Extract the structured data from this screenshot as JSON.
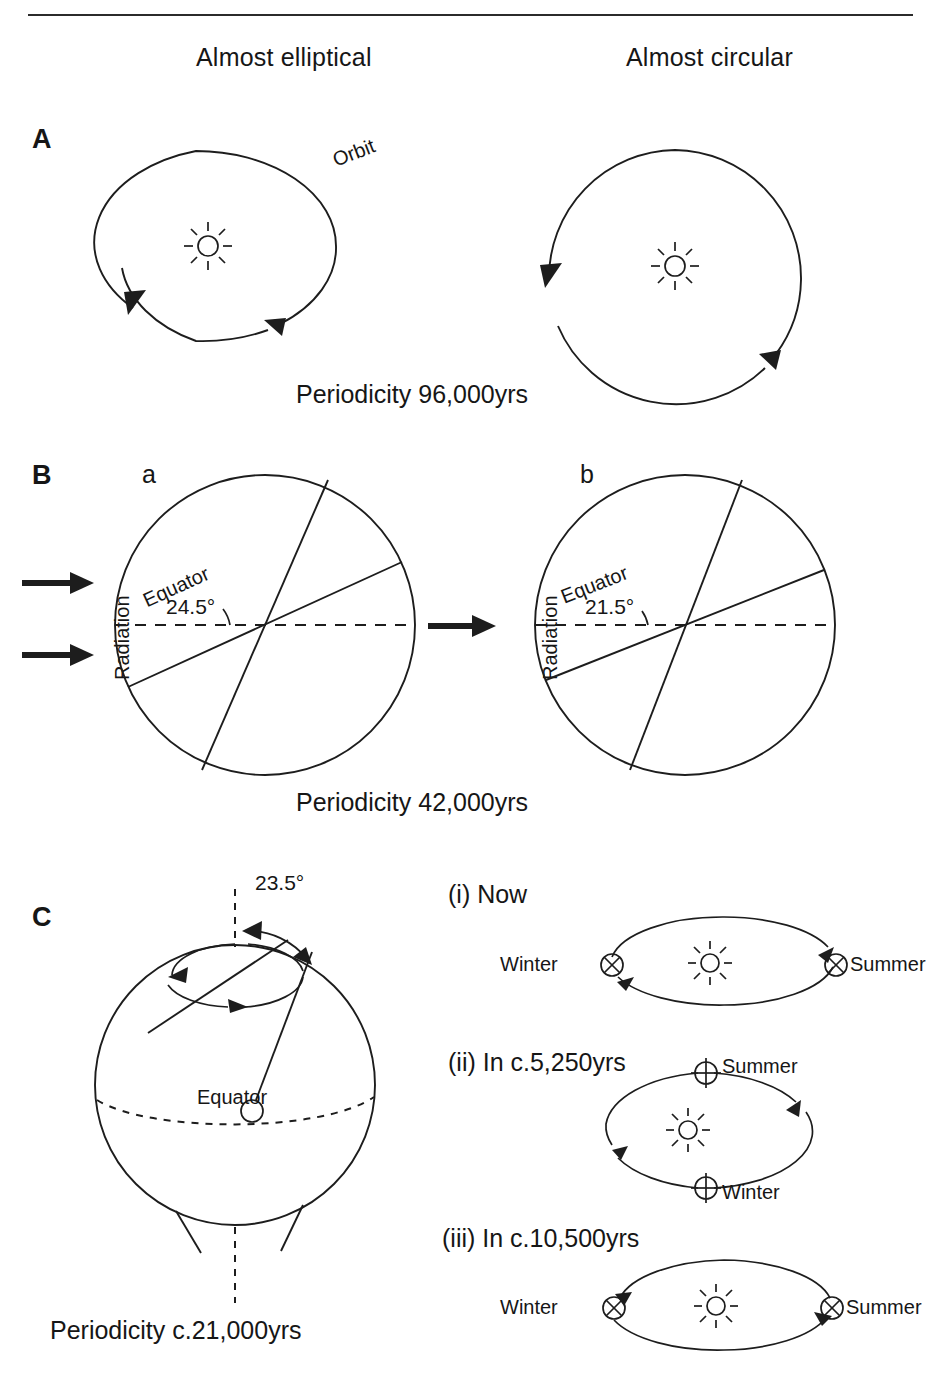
{
  "figure": {
    "column_headings": [
      {
        "id": "left",
        "label": "Almost elliptical"
      },
      {
        "id": "right",
        "label": "Almost circular"
      }
    ],
    "panels": [
      {
        "id": "A",
        "letter": "A",
        "topic": "eccentricity",
        "orbit_label": "Orbit",
        "caption": "Periodicity 96,000yrs",
        "shapes": [
          {
            "id": "A-left",
            "kind": "ellipse",
            "label": "Almost elliptical",
            "sun": "sun-symbol",
            "direction": "counterclockwise"
          },
          {
            "id": "A-right",
            "kind": "circle",
            "label": "Almost circular",
            "sun": "sun-symbol",
            "direction": "counterclockwise"
          }
        ]
      },
      {
        "id": "B",
        "letter": "B",
        "topic": "obliquity",
        "radiation_label": "Radiation",
        "caption": "Periodicity 42,000yrs",
        "sub_panels": [
          {
            "id": "a",
            "letter": "a",
            "equator_label": "Equator",
            "tilt_angle": "24.5°",
            "radiation_arrows": 2
          },
          {
            "id": "b",
            "letter": "b",
            "equator_label": "Equator",
            "tilt_angle": "21.5°",
            "radiation_arrows": 1
          }
        ]
      },
      {
        "id": "C",
        "letter": "C",
        "topic": "precession",
        "tilt_angle": "23.5°",
        "equator_label": "Equator",
        "caption": "Periodicity c.21,000yrs",
        "orbit_states": [
          {
            "id": "i",
            "label": "(i) Now",
            "earth_symbol": "earth-cross-circle",
            "positions": [
              {
                "season": "Winter",
                "at": "left"
              },
              {
                "season": "Summer",
                "at": "right"
              }
            ]
          },
          {
            "id": "ii",
            "label": "(ii) In c.5,250yrs",
            "earth_symbol": "earth-plus-circle",
            "positions": [
              {
                "season": "Summer",
                "at": "top"
              },
              {
                "season": "Winter",
                "at": "bottom"
              }
            ]
          },
          {
            "id": "iii",
            "label": "(iii) In c.10,500yrs",
            "earth_symbol": "earth-cross-circle",
            "positions": [
              {
                "season": "Winter",
                "at": "left"
              },
              {
                "season": "Summer",
                "at": "right"
              }
            ]
          }
        ]
      }
    ],
    "colors": {
      "ink": "#1d1d1d",
      "background": "#ffffff"
    }
  }
}
